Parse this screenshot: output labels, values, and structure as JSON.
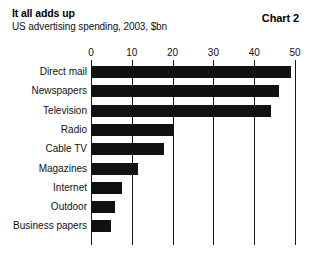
{
  "header": {
    "title": "It all adds up",
    "subtitle": "US advertising spending, 2003, $bn",
    "chart_number": "Chart 2"
  },
  "chart_data": {
    "type": "bar",
    "orientation": "horizontal",
    "title": "It all adds up",
    "subtitle": "US advertising spending, 2003, $bn",
    "xlabel": "",
    "ylabel": "",
    "units": "$bn",
    "xlim": [
      0,
      50
    ],
    "xticks": [
      0,
      10,
      20,
      30,
      40,
      50
    ],
    "xtick_labels": [
      "0",
      "10",
      "20",
      "30",
      "40",
      "50"
    ],
    "grid": true,
    "grid_axis": "x",
    "legend": false,
    "bar_color": "#111111",
    "categories": [
      "Direct mail",
      "Newspapers",
      "Television",
      "Radio",
      "Cable TV",
      "Magazines",
      "Internet",
      "Outdoor",
      "Business papers"
    ],
    "values": [
      49,
      46,
      44,
      20,
      18,
      11.5,
      7.5,
      6,
      5
    ]
  }
}
